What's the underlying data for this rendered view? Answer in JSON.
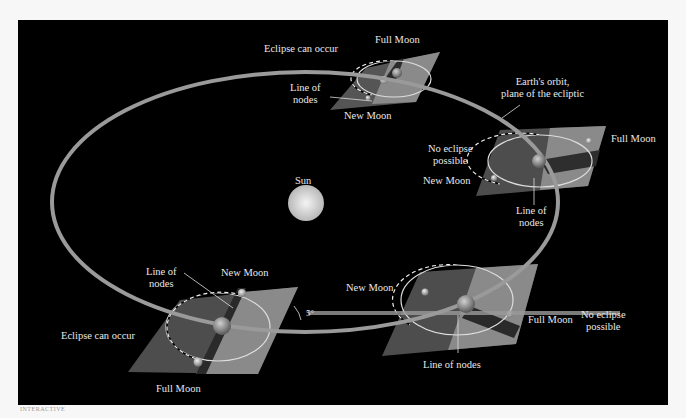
{
  "colors": {
    "background": "#000000",
    "orbit": "#9a9a9a",
    "plate_dark": "#4a4a4a",
    "plate_light": "#8a8a8a",
    "sun": "#d8d8d8",
    "text": "#e8e8e8"
  },
  "sun": {
    "label": "Sun"
  },
  "orbit": {
    "label_line1": "Earth's orbit,",
    "label_line2": "plane of the ecliptic"
  },
  "positions": [
    {
      "id": "top",
      "status": "Eclipse can occur",
      "full_moon": "Full Moon",
      "new_moon": "New Moon",
      "nodes_line1": "Line of",
      "nodes_line2": "nodes"
    },
    {
      "id": "right",
      "status_line1": "No eclipse",
      "status_line2": "possible",
      "full_moon": "Full Moon",
      "new_moon": "New Moon",
      "nodes_line1": "Line of",
      "nodes_line2": "nodes"
    },
    {
      "id": "bottom-left",
      "status": "Eclipse can occur",
      "full_moon": "Full Moon",
      "new_moon": "New Moon",
      "nodes_line1": "Line of",
      "nodes_line2": "nodes",
      "angle": "5°"
    },
    {
      "id": "bottom-right",
      "status_line1": "No eclipse",
      "status_line2": "possible",
      "full_moon": "Full Moon",
      "new_moon": "New Moon",
      "nodes": "Line of nodes"
    }
  ],
  "logo": "INTERACTIVE"
}
